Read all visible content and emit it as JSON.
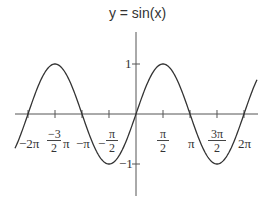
{
  "chart_data": {
    "type": "line",
    "title": "y = sin(x)",
    "function": "sin(x)",
    "xlabel": "",
    "ylabel": "",
    "xlim": [
      -6.8,
      7.1
    ],
    "ylim": [
      -1.6,
      1.4
    ],
    "grid": false,
    "legend": null,
    "x_ticks": [
      {
        "value": -6.283,
        "label": "-2π"
      },
      {
        "value": -4.712,
        "label": "-3/2 π"
      },
      {
        "value": -3.142,
        "label": "-π"
      },
      {
        "value": -1.571,
        "label": "-π/2"
      },
      {
        "value": 1.571,
        "label": "π/2"
      },
      {
        "value": 3.142,
        "label": "π"
      },
      {
        "value": 4.712,
        "label": "3π/2"
      },
      {
        "value": 6.283,
        "label": "2π"
      }
    ],
    "y_ticks": [
      {
        "value": 1,
        "label": "1"
      },
      {
        "value": -1,
        "label": "-1"
      }
    ],
    "series": [
      {
        "name": "sin(x)",
        "x": [
          -7.0,
          -6.283,
          -5.498,
          -4.712,
          -3.927,
          -3.142,
          -2.356,
          -1.571,
          -0.785,
          0,
          0.785,
          1.571,
          2.356,
          3.142,
          3.927,
          4.712,
          5.498,
          6.283,
          7.2
        ],
        "values": [
          -0.657,
          0,
          0.707,
          1,
          0.707,
          0,
          -0.707,
          -1,
          -0.707,
          0,
          0.707,
          1,
          0.707,
          0,
          -0.707,
          -1,
          -0.707,
          0,
          0.794
        ]
      }
    ]
  },
  "labels": {
    "title": "y = sin(x)",
    "x_neg2pi": "−2π",
    "x_neg3half_num": "−3",
    "x_neg3half_den": "2",
    "x_neg3half_pi": "π",
    "x_negpi": "−π",
    "x_neghalf_sign": "−",
    "x_neghalf_num": "π",
    "x_neghalf_den": "2",
    "x_half_num": "π",
    "x_half_den": "2",
    "x_pi": "π",
    "x_3half_num": "3π",
    "x_3half_den": "2",
    "x_2pi": "2π",
    "y_one": "1",
    "y_negone": "−1"
  },
  "colors": {
    "curve": "#333333",
    "axis": "#555555",
    "text": "#333333"
  }
}
